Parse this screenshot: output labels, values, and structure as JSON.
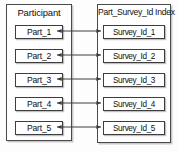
{
  "diagram": {
    "type": "entity-relationship-mapping",
    "background_color": "#fdfdfd",
    "line_color": "#3d3d3d",
    "box_fill": "#ffffff",
    "panels": [
      {
        "id": "participant",
        "title": "Participant",
        "items": [
          {
            "label": "Part_1"
          },
          {
            "label": "Part_2"
          },
          {
            "label": "Part_3"
          },
          {
            "label": "Part_4"
          },
          {
            "label": "Part_5"
          }
        ]
      },
      {
        "id": "part_survey_id_index",
        "title": "Part_Survey_Id Index",
        "items": [
          {
            "label": "Survey_Id_1"
          },
          {
            "label": "Survey_Id_2"
          },
          {
            "label": "Survey_Id_3"
          },
          {
            "label": "Survey_Id_4"
          },
          {
            "label": "Survey_Id_5"
          }
        ]
      }
    ],
    "connectors": [
      {
        "from": "Part_1",
        "to": "Survey_Id_1",
        "style": "double-arrow"
      },
      {
        "from": "Part_2",
        "to": "Survey_Id_2",
        "style": "double-arrow"
      },
      {
        "from": "Part_3",
        "to": "Survey_Id_3",
        "style": "double-arrow"
      },
      {
        "from": "Part_4",
        "to": "Survey_Id_4",
        "style": "double-arrow"
      },
      {
        "from": "Part_5",
        "to": "Survey_Id_5",
        "style": "double-arrow"
      }
    ]
  }
}
